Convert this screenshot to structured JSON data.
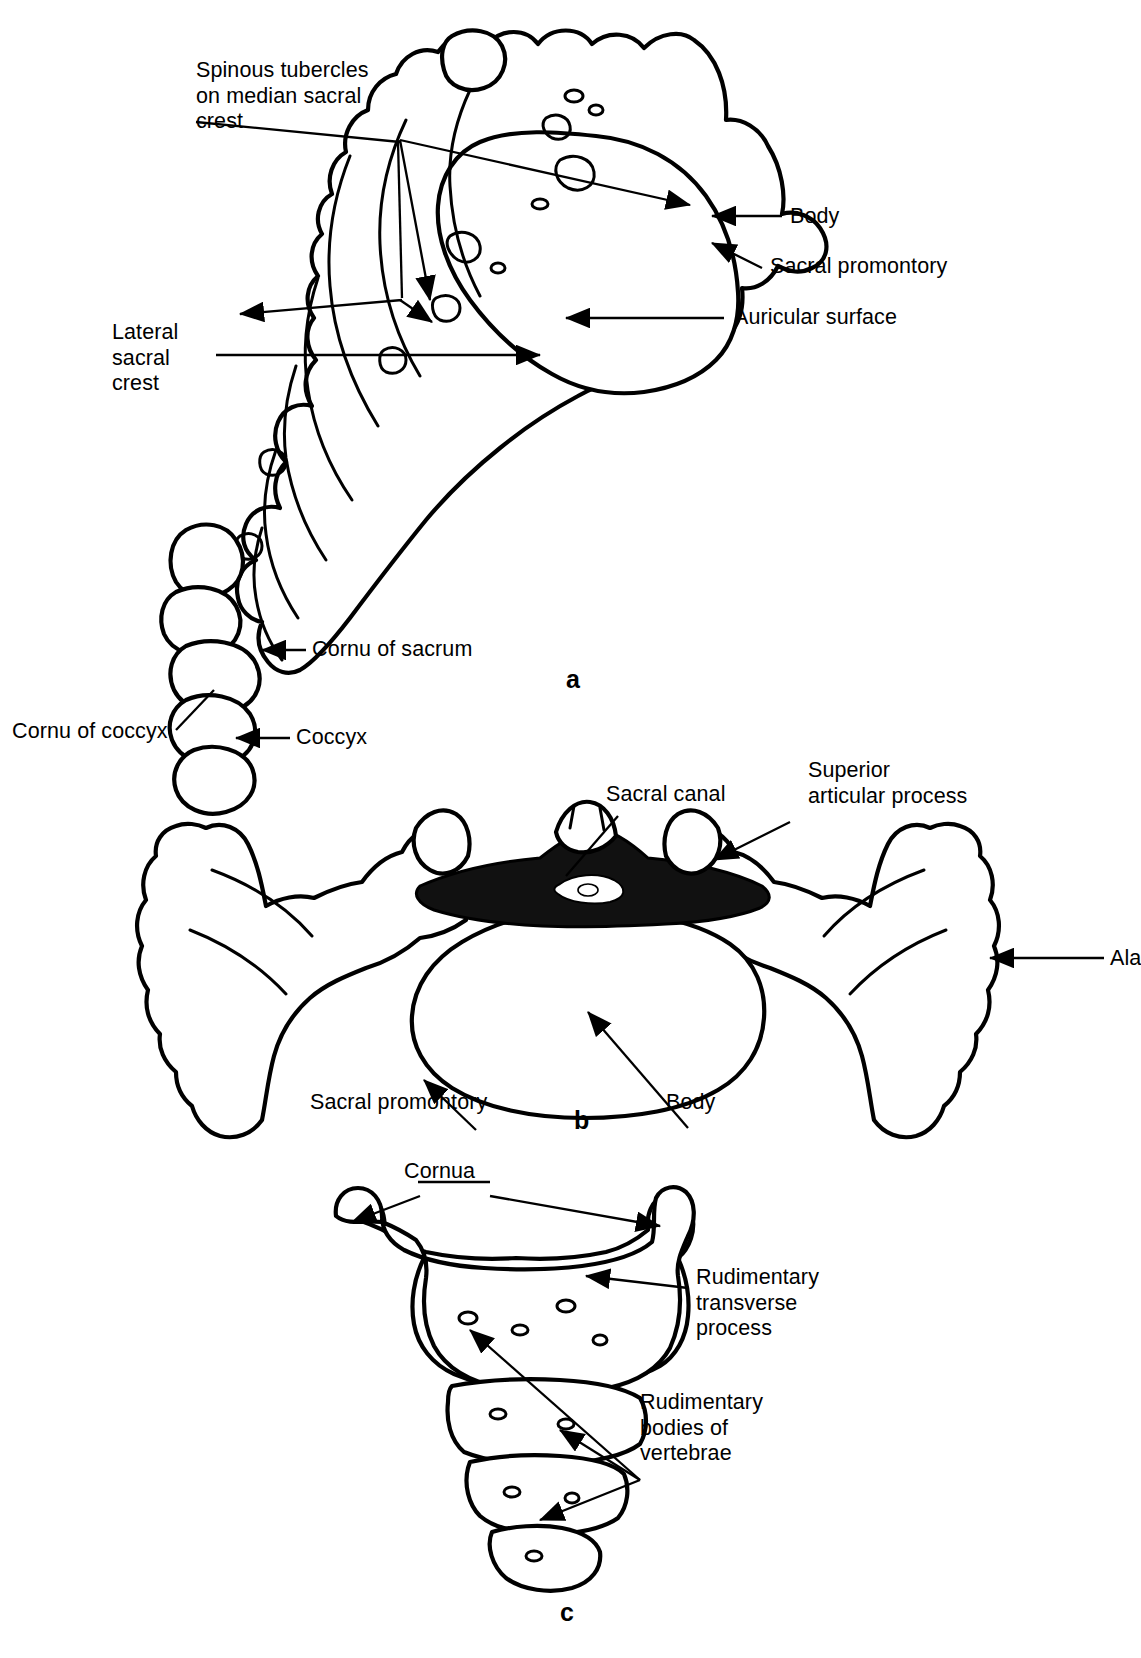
{
  "figure": {
    "panels": [
      {
        "id": "a",
        "letter": "a",
        "caption": "Lateral view of sacrum and coccyx",
        "labels": [
          "Spinous tubercles\non median sacral\ncrest",
          "Lateral\nsacral\ncrest",
          "Body",
          "Sacral promontory",
          "Auricular surface",
          "Cornu of sacrum",
          "Cornu of coccyx",
          "Coccyx"
        ]
      },
      {
        "id": "b",
        "letter": "b",
        "caption": "Superior view of base of sacrum",
        "labels": [
          "Sacral canal",
          "Superior\narticular process",
          "Ala",
          "Sacral promontory",
          "Body"
        ]
      },
      {
        "id": "c",
        "letter": "c",
        "caption": "Anterior view of coccyx",
        "labels": [
          "Cornua",
          "Rudimentary\ntransverse\nprocess",
          "Rudimentary\nbodies of\nvertebrae"
        ]
      }
    ]
  },
  "panel_a": {
    "letter": "a",
    "label_spinous": "Spinous tubercles\non median sacral\ncrest",
    "label_lateral_crest": "Lateral\nsacral\ncrest",
    "label_body": "Body",
    "label_promontory": "Sacral promontory",
    "label_auricular": "Auricular surface",
    "label_cornu_sacrum": "Cornu of sacrum",
    "label_cornu_coccyx": "Cornu of coccyx",
    "label_coccyx": "Coccyx"
  },
  "panel_b": {
    "letter": "b",
    "label_sacral_canal": "Sacral canal",
    "label_superior_articular": "Superior\narticular process",
    "label_ala": "Ala",
    "label_promontory": "Sacral promontory",
    "label_body": "Body"
  },
  "panel_c": {
    "letter": "c",
    "label_cornua": "Cornua",
    "label_transverse": "Rudimentary\ntransverse\nprocess",
    "label_bodies": "Rudimentary\nbodies of\nvertebrae"
  },
  "colors": {
    "ink": "#000000",
    "paper": "#ffffff",
    "stipple": "#1a1a1a"
  }
}
